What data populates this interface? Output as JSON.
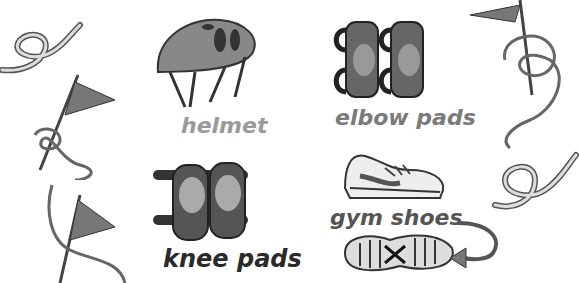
{
  "labels": {
    "helmet": "helmet",
    "elbow_pads": "elbow pads",
    "gym_shoes": "gym shoes",
    "knee_pads": "knee pads"
  },
  "colors": {
    "helmet_label": "#9a9a9a",
    "elbow_label": "#7a7a7a",
    "gym_label": "#555555",
    "knee_label": "#2a2a2a"
  }
}
